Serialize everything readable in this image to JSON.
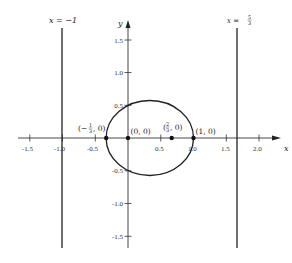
{
  "diagram": {
    "type": "graph-plot",
    "x_axis": {
      "label": "x",
      "ticks": [
        "-1.5",
        "-1.0",
        "-0.5",
        "0.5",
        "1.0",
        "1.5",
        "2.0"
      ],
      "tick_values": [
        -1.5,
        -1.0,
        -0.5,
        0.5,
        1.0,
        1.5,
        2.0
      ]
    },
    "y_axis": {
      "label": "y",
      "ticks": [
        "1.5",
        "1.0",
        "0.5",
        "-0.5",
        "-1.0",
        "-1.5"
      ],
      "tick_values": [
        1.5,
        1.0,
        0.5,
        -0.5,
        -1.0,
        -1.5
      ]
    },
    "vertical_lines": [
      {
        "label": "x = −1",
        "x": -1
      },
      {
        "label_prefix": "x = ",
        "label_num": "5",
        "label_den": "3",
        "x": 1.6667
      }
    ],
    "curve": {
      "type": "ellipse",
      "center": [
        0.3333,
        0
      ],
      "x_intercepts": [
        -0.3333,
        1.0
      ],
      "y_intercepts": [
        0.5,
        -0.5
      ]
    },
    "points": [
      {
        "label_prefix": "(−",
        "label_num": "1",
        "label_den": "3",
        "label_suffix": ", 0)",
        "x": -0.3333,
        "y": 0
      },
      {
        "label": "(0, 0)",
        "x": 0,
        "y": 0
      },
      {
        "label_prefix": "(",
        "label_num": "2",
        "label_den": "3",
        "label_suffix": ", 0)",
        "x": 0.6667,
        "y": 0
      },
      {
        "label": "(1, 0)",
        "x": 1,
        "y": 0
      }
    ]
  }
}
